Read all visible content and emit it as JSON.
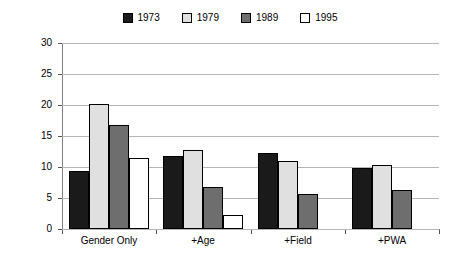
{
  "chart_data": {
    "type": "bar",
    "title": "",
    "subtitle": "",
    "xlabel": "",
    "ylabel": "Percent Higher Salary for Men",
    "ylim": [
      0,
      30
    ],
    "ytick_step": 5,
    "ytick_labels": [
      "30",
      "25",
      "20",
      "15",
      "10",
      "5",
      "0"
    ],
    "ytick_values": [
      30,
      25,
      20,
      15,
      10,
      5,
      0
    ],
    "grid": true,
    "grid_axis": "y",
    "legend_position": "top-center",
    "categories": [
      "Gender Only",
      "+Age",
      "+Field",
      "+PWA"
    ],
    "series": [
      {
        "name": "1973",
        "color": "#1a1a1a",
        "values": [
          9.3,
          11.8,
          12.3,
          9.9
        ]
      },
      {
        "name": "1979",
        "color": "#e0e0e0",
        "values": [
          20.1,
          12.7,
          11.0,
          10.4
        ]
      },
      {
        "name": "1989",
        "color": "#6e6e6e",
        "values": [
          16.8,
          6.8,
          5.6,
          6.3
        ]
      },
      {
        "name": "1995",
        "color": "#ffffff",
        "values": [
          11.5,
          2.2,
          null,
          null
        ]
      }
    ]
  },
  "legend": {
    "items": [
      {
        "label": "1973",
        "color": "#1a1a1a"
      },
      {
        "label": "1979",
        "color": "#e0e0e0"
      },
      {
        "label": "1989",
        "color": "#6e6e6e"
      },
      {
        "label": "1995",
        "color": "#ffffff"
      }
    ]
  },
  "axes": {
    "y_title": "Percent Higher Salary for Men",
    "y_ticks": [
      "30",
      "25",
      "20",
      "15",
      "10",
      "5",
      "0"
    ],
    "x_ticks": [
      "Gender Only",
      "+Age",
      "+Field",
      "+PWA"
    ]
  }
}
